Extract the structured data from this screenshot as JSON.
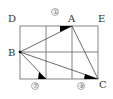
{
  "diagram": {
    "type": "geometry-grid",
    "grid": {
      "columns": 3,
      "rows": 2
    },
    "points": [
      {
        "name": "D",
        "label": "D",
        "x": 20,
        "y": 26,
        "lx": 8,
        "ly": 22
      },
      {
        "name": "A",
        "label": "A",
        "x": 72,
        "y": 26,
        "lx": 68,
        "ly": 22
      },
      {
        "name": "E",
        "label": "E",
        "x": 98,
        "y": 26,
        "lx": 98,
        "ly": 22
      },
      {
        "name": "B",
        "label": "B",
        "x": 20,
        "y": 52,
        "lx": 8,
        "ly": 56
      },
      {
        "name": "C",
        "label": "C",
        "x": 98,
        "y": 79,
        "lx": 99,
        "ly": 88
      }
    ],
    "angle_markers": [
      {
        "name": "angle-1",
        "label": "①",
        "x": 55,
        "y": 15
      },
      {
        "name": "angle-7",
        "label": "⑦",
        "x": 35,
        "y": 88
      },
      {
        "name": "angle-9",
        "label": "⑨",
        "x": 81,
        "y": 88
      }
    ],
    "colors": {
      "line": "#555555",
      "fill": "#000000",
      "text": "#333333"
    }
  }
}
